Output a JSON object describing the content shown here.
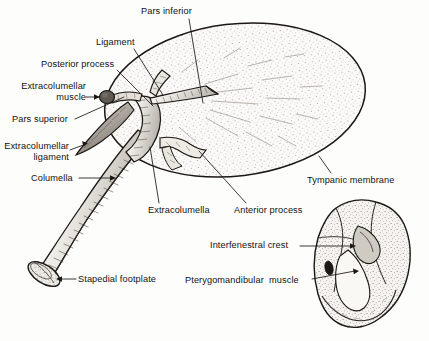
{
  "figure": {
    "background_color": "#fdfdfc",
    "ink_color": "#14110f",
    "stipple_color": "#6e6a64",
    "fill_color": "#f4f2ee"
  },
  "labels": [
    {
      "id": "pars-inferior",
      "text": "Pars inferior",
      "x": 141,
      "y": 6,
      "align": "left",
      "leader": {
        "from": [
          189,
          19
        ],
        "to": [
          203,
          103
        ]
      }
    },
    {
      "id": "ligament",
      "text": "Ligament",
      "x": 96,
      "y": 37,
      "align": "left",
      "leader": {
        "from": [
          134,
          49
        ],
        "to": [
          163,
          95
        ]
      }
    },
    {
      "id": "posterior-process",
      "text": "Posterior process",
      "x": 41,
      "y": 59,
      "align": "left",
      "leader": {
        "from": [
          117,
          70
        ],
        "to": [
          153,
          106
        ]
      }
    },
    {
      "id": "extracolumellar-muscle",
      "text": "Extracolumellar\nmuscle",
      "x": 6,
      "y": 81,
      "align": "right",
      "leader": {
        "from": [
          92,
          98
        ],
        "to": [
          102,
          98
        ]
      },
      "arrow": true
    },
    {
      "id": "pars-superior",
      "text": "Pars superior",
      "x": 12,
      "y": 114,
      "align": "left",
      "leader": {
        "from": [
          75,
          119
        ],
        "to": [
          124,
          97
        ]
      }
    },
    {
      "id": "extracolumellar-ligament",
      "text": "Extracolumellar\nligament",
      "x": 3,
      "y": 141,
      "align": "left",
      "leader": {
        "from": [
          75,
          148
        ],
        "to": [
          89,
          141
        ]
      },
      "arrow": true
    },
    {
      "id": "columella",
      "text": "Columella",
      "x": 31,
      "y": 173,
      "align": "left",
      "leader": {
        "from": [
          81,
          178
        ],
        "to": [
          115,
          178
        ]
      },
      "arrow": true
    },
    {
      "id": "stapedial-footplate",
      "text": "Stapedial footplate",
      "x": 78,
      "y": 274,
      "align": "left",
      "leader": {
        "from": [
          74,
          279
        ],
        "to": [
          58,
          279
        ]
      },
      "arrow": true
    },
    {
      "id": "extracolumella",
      "text": "Extracolumella",
      "x": 148,
      "y": 205,
      "align": "left",
      "leader": {
        "from": [
          159,
          203
        ],
        "to": [
          150,
          147
        ]
      }
    },
    {
      "id": "anterior-process",
      "text": "Anterior process",
      "x": 234,
      "y": 205,
      "align": "left",
      "leader": {
        "from": [
          246,
          203
        ],
        "to": [
          199,
          151
        ]
      }
    },
    {
      "id": "tympanic-membrane",
      "text": "Tympanic membrane",
      "x": 307,
      "y": 175,
      "align": "left",
      "leader": {
        "from": [
          331,
          173
        ],
        "to": [
          319,
          156
        ]
      }
    },
    {
      "id": "interfenestral-crest",
      "text": "Interfenestral crest",
      "x": 210,
      "y": 240,
      "align": "left",
      "leader": {
        "from": [
          300,
          246
        ],
        "to": [
          355,
          246
        ]
      },
      "arrow": true
    },
    {
      "id": "pterygomandibular-muscle",
      "text": "Pterygomandibular  muscle",
      "x": 185,
      "y": 275,
      "align": "left",
      "leader": {
        "from": [
          312,
          279
        ],
        "to": [
          357,
          272
        ]
      },
      "arrow": true
    }
  ],
  "structures": [
    {
      "id": "tympanic-membrane-oval",
      "name": "tympanic membrane",
      "shape": "ellipse"
    },
    {
      "id": "columella-shaft",
      "name": "columella",
      "shape": "tapered-rod"
    },
    {
      "id": "stapedial-footplate-disc",
      "name": "stapedial footplate",
      "shape": "ellipse-disc"
    },
    {
      "id": "extracolumella-body",
      "name": "extracolumella",
      "shape": "branching"
    },
    {
      "id": "pars-inferior-process",
      "name": "pars inferior",
      "shape": "spur"
    },
    {
      "id": "pars-superior-process",
      "name": "pars superior",
      "shape": "spur"
    },
    {
      "id": "posterior-process-spur",
      "name": "posterior process",
      "shape": "spur"
    },
    {
      "id": "anterior-process-spur",
      "name": "anterior process",
      "shape": "spur"
    },
    {
      "id": "extracolumellar-ligament-blade",
      "name": "extracolumellar ligament",
      "shape": "blade"
    },
    {
      "id": "extracolumellar-muscle-knob",
      "name": "extracolumellar muscle",
      "shape": "knob"
    },
    {
      "id": "inset-middle-ear",
      "name": "middle ear inset",
      "shape": "irregular-mass"
    },
    {
      "id": "interfenestral-crest-ridge",
      "name": "interfenestral crest",
      "shape": "ridge"
    },
    {
      "id": "pterygomandibular-muscle-foramen",
      "name": "pterygomandibular muscle",
      "shape": "foramen"
    }
  ]
}
